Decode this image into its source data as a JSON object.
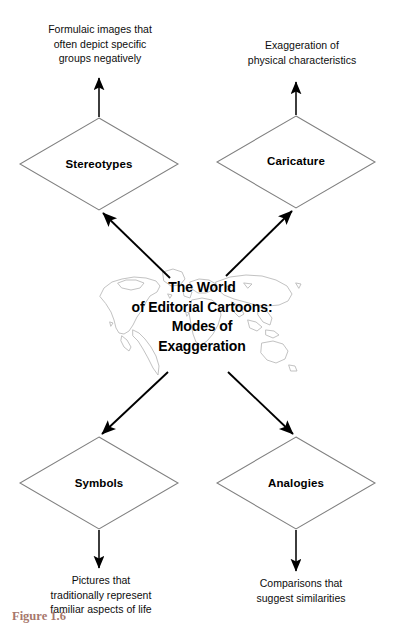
{
  "figure": {
    "caption": "Figure 1.6",
    "center_title": "The World\nof Editorial Cartoons:\nModes of\nExaggeration",
    "background_graphic": "world-map-outline"
  },
  "colors": {
    "background": "#ffffff",
    "node_stroke": "#808080",
    "arrow": "#000000",
    "text": "#0d0d0d",
    "caption_color": "#8a4a3a",
    "map_outline": "#8c8c8c"
  },
  "nodes": [
    {
      "id": "stereotypes",
      "label": "Stereotypes",
      "shape": "diamond",
      "position": "top-left",
      "description": "Formulaic images that\noften depict specific\ngroups negatively"
    },
    {
      "id": "caricature",
      "label": "Caricature",
      "shape": "diamond",
      "position": "top-right",
      "description": "Exaggeration of\nphysical characteristics"
    },
    {
      "id": "symbols",
      "label": "Symbols",
      "shape": "diamond",
      "position": "bottom-left",
      "description": "Pictures that\ntraditionally represent\nfamiliar aspects of life"
    },
    {
      "id": "analogies",
      "label": "Analogies",
      "shape": "diamond",
      "position": "bottom-right",
      "description": "Comparisons that\nsuggest similarities"
    }
  ],
  "connectors": [
    {
      "id": "center-to-stereotypes",
      "from": "center",
      "to": "stereotypes",
      "style": "arrow"
    },
    {
      "id": "center-to-caricature",
      "from": "center",
      "to": "caricature",
      "style": "arrow"
    },
    {
      "id": "center-to-symbols",
      "from": "center",
      "to": "symbols",
      "style": "arrow"
    },
    {
      "id": "center-to-analogies",
      "from": "center",
      "to": "analogies",
      "style": "arrow"
    },
    {
      "id": "stereotypes-to-description",
      "from": "stereotypes",
      "to": "description",
      "style": "arrow"
    },
    {
      "id": "caricature-to-description",
      "from": "caricature",
      "to": "description",
      "style": "arrow"
    },
    {
      "id": "symbols-to-description",
      "from": "symbols",
      "to": "description",
      "style": "arrow"
    },
    {
      "id": "analogies-to-description",
      "from": "analogies",
      "to": "description",
      "style": "arrow"
    }
  ]
}
